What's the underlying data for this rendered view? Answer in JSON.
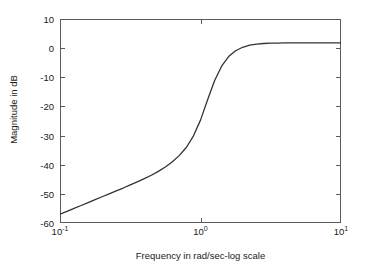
{
  "chart_data": {
    "type": "line",
    "title": "",
    "subtitle": "",
    "xlabel": "Frequency in rad/sec-log scale",
    "ylabel": "Magnitude in dB",
    "xscale": "log",
    "xlim": [
      0.1,
      10
    ],
    "ylim": [
      -60,
      10
    ],
    "grid": true,
    "legend": null,
    "legend_position": "none",
    "xticks": [
      {
        "value": 0.1,
        "label": "10",
        "exponent": "-1"
      },
      {
        "value": 1,
        "label": "10",
        "exponent": "0"
      },
      {
        "value": 10,
        "label": "10",
        "exponent": "1"
      }
    ],
    "yticks": [
      {
        "value": 10,
        "label": "10"
      },
      {
        "value": 0,
        "label": "0"
      },
      {
        "value": -10,
        "label": "-10"
      },
      {
        "value": -20,
        "label": "-20"
      },
      {
        "value": -30,
        "label": "-30"
      },
      {
        "value": -40,
        "label": "-40"
      },
      {
        "value": -50,
        "label": "-50"
      },
      {
        "value": -60,
        "label": "-60"
      }
    ],
    "series": [
      {
        "name": "Magnitude",
        "color": "#333333",
        "linewidth": 1.3,
        "x": [
          0.1,
          0.1122,
          0.1259,
          0.1413,
          0.1585,
          0.1778,
          0.1995,
          0.2239,
          0.2512,
          0.2818,
          0.3162,
          0.3548,
          0.3981,
          0.4467,
          0.5012,
          0.5623,
          0.631,
          0.7079,
          0.7943,
          0.8913,
          1.0,
          1.122,
          1.259,
          1.413,
          1.585,
          1.778,
          1.995,
          2.239,
          2.512,
          2.818,
          3.162,
          3.548,
          3.981,
          4.467,
          5.012,
          5.623,
          6.31,
          7.079,
          7.943,
          8.913,
          10.0
        ],
        "y": [
          -57.0,
          -56.0,
          -55.0,
          -54.0,
          -53.0,
          -52.0,
          -51.0,
          -50.0,
          -49.0,
          -48.0,
          -46.9,
          -45.9,
          -44.8,
          -43.6,
          -42.3,
          -40.8,
          -39.0,
          -36.8,
          -34.0,
          -30.1,
          -24.7,
          -17.8,
          -11.2,
          -6.2,
          -2.9,
          -0.9,
          0.3,
          1.0,
          1.4,
          1.6,
          1.7,
          1.75,
          1.78,
          1.8,
          1.81,
          1.82,
          1.82,
          1.83,
          1.83,
          1.83,
          1.83
        ]
      }
    ],
    "annotations": []
  },
  "figure": {
    "background_color": "#ffffff",
    "frame_color": "#5a5a5a",
    "grid_color": "#e2e2e2",
    "text_color": "#1a1a1a"
  }
}
